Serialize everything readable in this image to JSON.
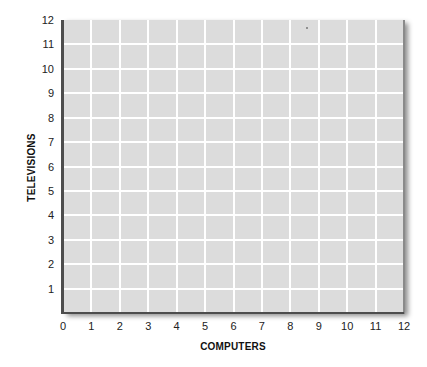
{
  "chart_data": {
    "type": "scatter",
    "title": "",
    "xlabel": "COMPUTERS",
    "ylabel": "TELEVISIONS",
    "xlim": [
      0,
      12
    ],
    "ylim": [
      0,
      12
    ],
    "x_ticks": [
      "0",
      "1",
      "2",
      "3",
      "4",
      "5",
      "6",
      "7",
      "8",
      "9",
      "10",
      "11",
      "12"
    ],
    "y_ticks": [
      "1",
      "2",
      "3",
      "4",
      "5",
      "6",
      "7",
      "8",
      "9",
      "10",
      "11",
      "12"
    ],
    "grid": true,
    "series": [],
    "legend": null,
    "note": "Blank grid with no plotted data"
  },
  "colors": {
    "plot_background": "#dcdcdc",
    "grid": "#ffffff",
    "axis": "#4d4d4d",
    "text": "#222222"
  }
}
